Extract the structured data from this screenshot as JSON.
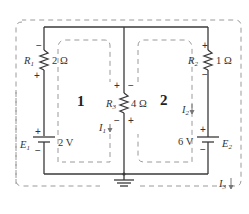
{
  "circuit": {
    "resistors": [
      {
        "name": "R",
        "sub": "1",
        "value": "2 Ω",
        "top_sign": "−",
        "bottom_sign": "+"
      },
      {
        "name": "R",
        "sub": "2",
        "value": "1 Ω",
        "top_sign": "+",
        "bottom_sign": "−"
      },
      {
        "name": "R",
        "sub": "3",
        "value": "4 Ω",
        "top_left_sign": "+",
        "top_right_sign": "−",
        "bottom_left_sign": "−",
        "bottom_right_sign": "+"
      }
    ],
    "sources": [
      {
        "name": "E",
        "sub": "1",
        "value": "2 V",
        "top_sign": "+",
        "bottom_sign": "−"
      },
      {
        "name": "E",
        "sub": "2",
        "value": "6 V",
        "top_sign": "+",
        "bottom_sign": "−"
      }
    ],
    "loops": [
      {
        "label": "1",
        "current": "I",
        "current_sub": "1"
      },
      {
        "label": "2",
        "current": "I",
        "current_sub": "2"
      },
      {
        "label": "",
        "current": "I",
        "current_sub": "3"
      }
    ],
    "ground": "ground-symbol"
  }
}
